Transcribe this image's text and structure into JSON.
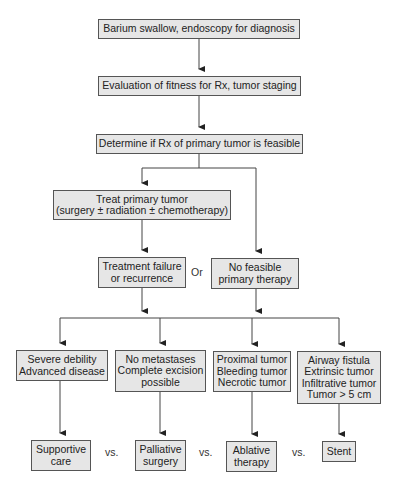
{
  "diagram": {
    "nodes": {
      "diagnosis": {
        "lines": [
          "Barium swallow, endoscopy for diagnosis"
        ]
      },
      "evaluation": {
        "lines": [
          "Evaluation of fitness for Rx, tumor staging"
        ]
      },
      "determine": {
        "lines": [
          "Determine if Rx of primary tumor is feasible"
        ]
      },
      "treat": {
        "lines": [
          "Treat primary tumor",
          "(surgery ± radiation ± chemotherapy)"
        ]
      },
      "failure": {
        "lines": [
          "Treatment failure",
          "or recurrence"
        ]
      },
      "no_feasible": {
        "lines": [
          "No feasible",
          "primary therapy"
        ]
      },
      "severe": {
        "lines": [
          "Severe debility",
          "Advanced disease"
        ]
      },
      "no_metastases": {
        "lines": [
          "No metastases",
          "Complete excision",
          "possible"
        ]
      },
      "proximal": {
        "lines": [
          "Proximal tumor",
          "Bleeding tumor",
          "Necrotic tumor"
        ]
      },
      "airway": {
        "lines": [
          "Airway fistula",
          "Extrinsic tumor",
          "Infiltrative tumor",
          "Tumor > 5 cm"
        ]
      },
      "supportive": {
        "lines": [
          "Supportive",
          "care"
        ]
      },
      "palliative": {
        "lines": [
          "Palliative",
          "surgery"
        ]
      },
      "ablative": {
        "lines": [
          "Ablative",
          "therapy"
        ]
      },
      "stent": {
        "lines": [
          "Stent"
        ]
      }
    },
    "connector_labels": {
      "or": "Or",
      "vs1": "vs.",
      "vs2": "vs.",
      "vs3": "vs."
    },
    "edges": [
      [
        "diagnosis",
        "evaluation"
      ],
      [
        "evaluation",
        "determine"
      ],
      [
        "determine",
        "treat"
      ],
      [
        "determine",
        "no_feasible"
      ],
      [
        "treat",
        "failure"
      ],
      [
        "failure",
        "severe"
      ],
      [
        "failure",
        "no_metastases"
      ],
      [
        "no_feasible",
        "proximal"
      ],
      [
        "no_feasible",
        "airway"
      ],
      [
        "severe",
        "supportive"
      ],
      [
        "no_metastases",
        "palliative"
      ],
      [
        "proximal",
        "ablative"
      ],
      [
        "airway",
        "stent"
      ]
    ],
    "colors": {
      "box_fill": "#e6e6e6",
      "box_border": "#555555",
      "line": "#333333",
      "text": "#222222"
    }
  }
}
